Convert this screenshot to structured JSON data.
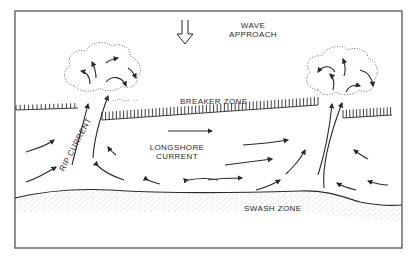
{
  "figure": {
    "type": "schematic diagram",
    "frame": {
      "left": 15,
      "top": 11,
      "right": 402,
      "bottom": 248,
      "stroke": "#555555"
    }
  },
  "labels": {
    "wave_approach_line1": "WAVE",
    "wave_approach_line2": "APPROACH",
    "breaker_zone": "BREAKER ZONE",
    "longshore_line1": "LONGSHORE",
    "longshore_line2": "CURRENT",
    "rip_current": "RIP CURRENT",
    "swash_zone": "SWASH ZONE"
  },
  "elements": [
    {
      "name": "wave-approach-arrow",
      "kind": "hollow down arrow"
    },
    {
      "name": "rip-head-left",
      "kind": "dotted cloud with curling arrows"
    },
    {
      "name": "rip-head-right",
      "kind": "dotted cloud with curling arrows"
    },
    {
      "name": "breaker-zone-hatching",
      "kind": "comb line (tick marks)"
    },
    {
      "name": "longshore-arrows",
      "kind": "curved flow arrows converging to rip necks"
    },
    {
      "name": "shoreline",
      "kind": "wavy line with stippled swash zone"
    }
  ],
  "colors": {
    "ink": "#2a2a2a",
    "stipple": "#9a9a9a",
    "frame": "#555555",
    "background": "#ffffff"
  }
}
